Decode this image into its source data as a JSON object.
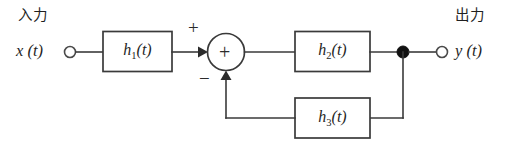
{
  "figure": {
    "kind": "block-diagram",
    "background_color": "#ffffff",
    "line_color": "#3a3a3a"
  },
  "input_port": {
    "jp_label": "入力",
    "signal_label": "x (t)",
    "terminal_icon": "open-circle-terminal"
  },
  "output_port": {
    "jp_label": "出力",
    "signal_label": "y (t)",
    "terminal_icon": "open-circle-terminal"
  },
  "blocks": [
    {
      "id": "h1",
      "name": "h",
      "subscript": "1",
      "arg": "(t)",
      "label": "h1(t)"
    },
    {
      "id": "h2",
      "name": "h",
      "subscript": "2",
      "arg": "(t)",
      "label": "h2(t)"
    },
    {
      "id": "h3",
      "name": "h",
      "subscript": "3",
      "arg": "(t)",
      "label": "h3(t)"
    }
  ],
  "summing_junction": {
    "glyph": "+",
    "icon": "summing-junction-circle",
    "inputs": [
      {
        "from": "h1",
        "sign": "+",
        "direction": "left"
      },
      {
        "from": "h3",
        "sign": "−",
        "direction": "bottom"
      }
    ]
  },
  "junction_node": {
    "icon": "filled-junction-dot",
    "description": "takeoff point feeding the feedback path"
  },
  "arrows": [
    {
      "id": "arrow-into-sum-left",
      "icon": "arrow-right"
    },
    {
      "id": "arrow-into-sum-bottom",
      "icon": "arrow-up"
    }
  ]
}
